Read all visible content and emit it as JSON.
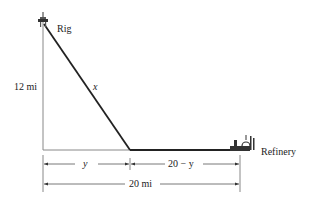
{
  "diagram": {
    "labels": {
      "rig": "Rig",
      "refinery": "Refinery",
      "vertical_distance": "12 mi",
      "hypotenuse": "x",
      "segment_left": "y",
      "segment_right": "20 − y",
      "total_distance": "20 mi"
    },
    "colors": {
      "line": "#222222",
      "guide_line": "#888888"
    },
    "icons": {
      "rig": "oil-rig-icon",
      "refinery": "refinery-icon"
    }
  }
}
